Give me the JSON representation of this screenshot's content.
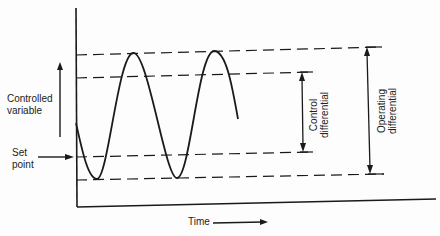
{
  "diagram": {
    "type": "on-off control oscillation diagram",
    "labels": {
      "y_axis": [
        "Controlled",
        "variable"
      ],
      "set_point": [
        "Set",
        "point"
      ],
      "x_axis": "Time",
      "control_differential": [
        "Control",
        "differential"
      ],
      "operating_differential": [
        "Operating",
        "differential"
      ]
    },
    "colors": {
      "line": "#1a1a1a",
      "background": "#fdfdfd"
    }
  }
}
